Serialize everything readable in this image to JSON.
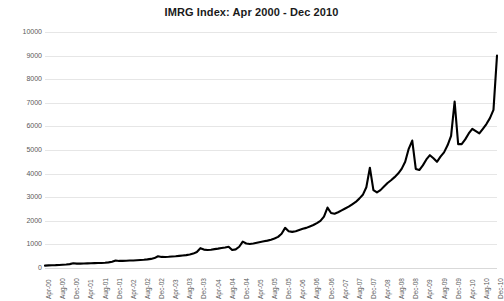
{
  "chart_data": {
    "type": "line",
    "title": "IMRG Index: Apr 2000 - Dec 2010",
    "xlabel": "",
    "ylabel": "",
    "ylim": [
      0,
      10000
    ],
    "ytick_values": [
      0,
      1000,
      2000,
      3000,
      4000,
      5000,
      6000,
      7000,
      8000,
      9000,
      10000
    ],
    "ytick_labels": [
      "0",
      "1000",
      "2000",
      "3000",
      "4000",
      "5000",
      "6000",
      "7000",
      "8000",
      "9000",
      "10000"
    ],
    "grid": true,
    "legend": "none",
    "line_color": "#000000",
    "background_color": "#ffffff",
    "gridline_color": "#e6e6e6",
    "xtick_labels": [
      "Apr-00",
      "Aug-00",
      "Dec-00",
      "Apr-01",
      "Aug-01",
      "Dec-01",
      "Apr-02",
      "Aug-02",
      "Dec-02",
      "Apr-03",
      "Aug-03",
      "Dec-03",
      "Apr-04",
      "Aug-04",
      "Dec-04",
      "Apr-05",
      "Aug-05",
      "Dec-05",
      "Apr-06",
      "Aug-06",
      "Dec-06",
      "Apr-07",
      "Aug-07",
      "Dec-07",
      "Apr-08",
      "Aug-08",
      "Dec-08",
      "Apr-09",
      "Aug-09",
      "Dec-09",
      "Apr-10",
      "Aug-10",
      "Dec-10"
    ],
    "xtick_interval_months": 4,
    "x": [
      "Apr-00",
      "May-00",
      "Jun-00",
      "Jul-00",
      "Aug-00",
      "Sep-00",
      "Oct-00",
      "Nov-00",
      "Dec-00",
      "Jan-01",
      "Feb-01",
      "Mar-01",
      "Apr-01",
      "May-01",
      "Jun-01",
      "Jul-01",
      "Aug-01",
      "Sep-01",
      "Oct-01",
      "Nov-01",
      "Dec-01",
      "Jan-02",
      "Feb-02",
      "Mar-02",
      "Apr-02",
      "May-02",
      "Jun-02",
      "Jul-02",
      "Aug-02",
      "Sep-02",
      "Oct-02",
      "Nov-02",
      "Dec-02",
      "Jan-03",
      "Feb-03",
      "Mar-03",
      "Apr-03",
      "May-03",
      "Jun-03",
      "Jul-03",
      "Aug-03",
      "Sep-03",
      "Oct-03",
      "Nov-03",
      "Dec-03",
      "Jan-04",
      "Feb-04",
      "Mar-04",
      "Apr-04",
      "May-04",
      "Jun-04",
      "Jul-04",
      "Aug-04",
      "Sep-04",
      "Oct-04",
      "Nov-04",
      "Dec-04",
      "Jan-05",
      "Feb-05",
      "Mar-05",
      "Apr-05",
      "May-05",
      "Jun-05",
      "Jul-05",
      "Aug-05",
      "Sep-05",
      "Oct-05",
      "Nov-05",
      "Dec-05",
      "Jan-06",
      "Feb-06",
      "Mar-06",
      "Apr-06",
      "May-06",
      "Jun-06",
      "Jul-06",
      "Aug-06",
      "Sep-06",
      "Oct-06",
      "Nov-06",
      "Dec-06",
      "Jan-07",
      "Feb-07",
      "Mar-07",
      "Apr-07",
      "May-07",
      "Jun-07",
      "Jul-07",
      "Aug-07",
      "Sep-07",
      "Oct-07",
      "Nov-07",
      "Dec-07",
      "Jan-08",
      "Feb-08",
      "Mar-08",
      "Apr-08",
      "May-08",
      "Jun-08",
      "Jul-08",
      "Aug-08",
      "Sep-08",
      "Oct-08",
      "Nov-08",
      "Dec-08",
      "Jan-09",
      "Feb-09",
      "Mar-09",
      "Apr-09",
      "May-09",
      "Jun-09",
      "Jul-09",
      "Aug-09",
      "Sep-09",
      "Oct-09",
      "Nov-09",
      "Dec-09",
      "Jan-10",
      "Feb-10",
      "Mar-10",
      "Apr-10",
      "May-10",
      "Jun-10",
      "Jul-10",
      "Aug-10",
      "Sep-10",
      "Oct-10",
      "Nov-10",
      "Dec-10"
    ],
    "values": [
      100,
      110,
      115,
      120,
      130,
      140,
      150,
      165,
      200,
      185,
      185,
      190,
      195,
      200,
      205,
      210,
      215,
      225,
      240,
      265,
      320,
      300,
      300,
      305,
      315,
      320,
      330,
      340,
      350,
      365,
      385,
      420,
      500,
      470,
      465,
      475,
      490,
      500,
      515,
      530,
      545,
      570,
      610,
      680,
      840,
      780,
      760,
      775,
      800,
      820,
      845,
      870,
      900,
      760,
      790,
      900,
      1120,
      1040,
      1020,
      1040,
      1070,
      1100,
      1130,
      1160,
      1200,
      1250,
      1320,
      1450,
      1700,
      1560,
      1530,
      1560,
      1610,
      1660,
      1700,
      1760,
      1820,
      1900,
      2000,
      2180,
      2560,
      2330,
      2300,
      2360,
      2440,
      2520,
      2600,
      2700,
      2800,
      2940,
      3100,
      3420,
      4250,
      3300,
      3200,
      3300,
      3450,
      3600,
      3720,
      3850,
      4000,
      4200,
      4500,
      5050,
      5400,
      4200,
      4150,
      4350,
      4600,
      4780,
      4650,
      4500,
      4720,
      4900,
      5200,
      5600,
      7050,
      5250,
      5250,
      5450,
      5700,
      5900,
      5800,
      5700,
      5900,
      6100,
      6350,
      6700,
      9000
    ]
  }
}
